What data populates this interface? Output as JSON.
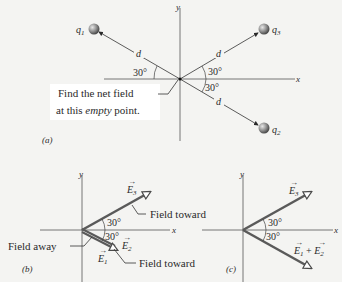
{
  "panel_a": {
    "caption": "(a)",
    "axis_x": "x",
    "axis_y": "y",
    "charges": [
      {
        "name": "q1",
        "label": "q",
        "sub": "1"
      },
      {
        "name": "q2",
        "label": "q",
        "sub": "2"
      },
      {
        "name": "q3",
        "label": "q",
        "sub": "3"
      }
    ],
    "distance_label": "d",
    "angle_label": "30°",
    "note_line1": "Find the net field",
    "note_line2_pre": "at this ",
    "note_line2_em": "empty",
    "note_line2_post": " point."
  },
  "panel_b": {
    "caption": "(b)",
    "axis_x": "x",
    "axis_y": "y",
    "angle_label": "30°",
    "vec_e1": "E",
    "vec_e1_sub": "1",
    "vec_e2": "E",
    "vec_e2_sub": "2",
    "vec_e3": "E",
    "vec_e3_sub": "3",
    "field_away": "Field away",
    "field_toward_top": "Field toward",
    "field_toward_bottom": "Field toward"
  },
  "panel_c": {
    "caption": "(c)",
    "axis_x": "x",
    "axis_y": "y",
    "angle_label": "30°",
    "vec_e3": "E",
    "vec_e3_sub": "3",
    "vec_sum_a": "E",
    "vec_sum_a_sub": "1",
    "vec_sum_plus": " + ",
    "vec_sum_b": "E",
    "vec_sum_b_sub": "2"
  },
  "colors": {
    "background": "#f4f4f2",
    "line": "#3a3a3a",
    "vector": "#5a5a5a",
    "charge": "#8a8a8a"
  }
}
